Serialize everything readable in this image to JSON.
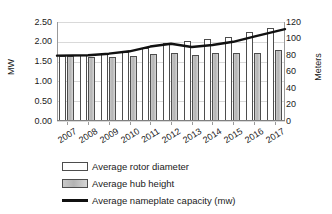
{
  "chart_data": {
    "type": "bar",
    "title": "",
    "xlabel": "",
    "ylabel": "MW",
    "y2label": "Meters",
    "categories": [
      "2007",
      "2008",
      "2009",
      "2010",
      "2011",
      "2012",
      "2013",
      "2014",
      "2015",
      "2016",
      "2017"
    ],
    "ylim": [
      0,
      2.5
    ],
    "y2lim": [
      0,
      120
    ],
    "yticks": [
      "0.00",
      "0.50",
      "1.00",
      "1.50",
      "2.00",
      "2.50"
    ],
    "y2ticks": [
      "0",
      "20",
      "40",
      "60",
      "80",
      "100",
      "120"
    ],
    "grid": true,
    "legend_position": "bottom",
    "series": [
      {
        "name": "Average rotor diameter",
        "type": "bar",
        "axis": "right",
        "unit": "meters",
        "color": "#ffffff",
        "values": [
          79,
          80,
          83,
          84,
          89,
          94,
          97,
          99,
          102,
          108,
          113
        ]
      },
      {
        "name": "Average hub height",
        "type": "bar",
        "axis": "right",
        "unit": "meters",
        "color": "#bfbfbf",
        "values": [
          79,
          78,
          78,
          79,
          81,
          83,
          80,
          82,
          82,
          83,
          86
        ]
      },
      {
        "name": "Average nameplate capacity (mw)",
        "type": "line",
        "axis": "left",
        "unit": "MW",
        "color": "#111111",
        "values": [
          1.65,
          1.66,
          1.7,
          1.76,
          1.88,
          1.95,
          1.87,
          1.92,
          2.0,
          2.13,
          2.32
        ]
      }
    ]
  },
  "legend": {
    "items": [
      {
        "label": "Average rotor diameter",
        "key": "white-bar-swatch"
      },
      {
        "label": "Average hub height",
        "key": "gray-bar-swatch"
      },
      {
        "label": "Average nameplate capacity (mw)",
        "key": "black-line-swatch"
      }
    ]
  }
}
